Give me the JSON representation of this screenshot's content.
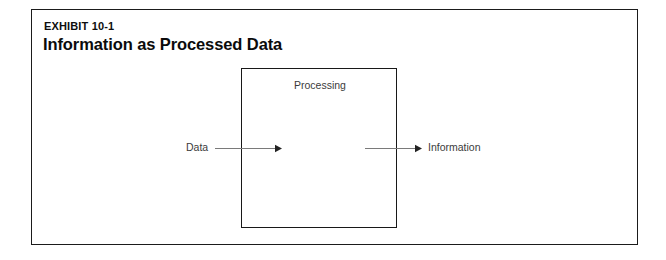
{
  "exhibit": {
    "number_label": "EXHIBIT 10-1",
    "title": "Information as Processed Data"
  },
  "diagram": {
    "type": "flow",
    "process_box_label": "Processing",
    "input_label": "Data",
    "output_label": "Information",
    "flow_description": "Data flows into Processing which outputs Information",
    "colors": {
      "frame_border": "#1b1b1b",
      "box_border": "#181818",
      "arrow": "#7a7a7a",
      "label_text": "#3b3b3b",
      "title_text": "#0b0b0b",
      "background": "#ffffff"
    }
  }
}
